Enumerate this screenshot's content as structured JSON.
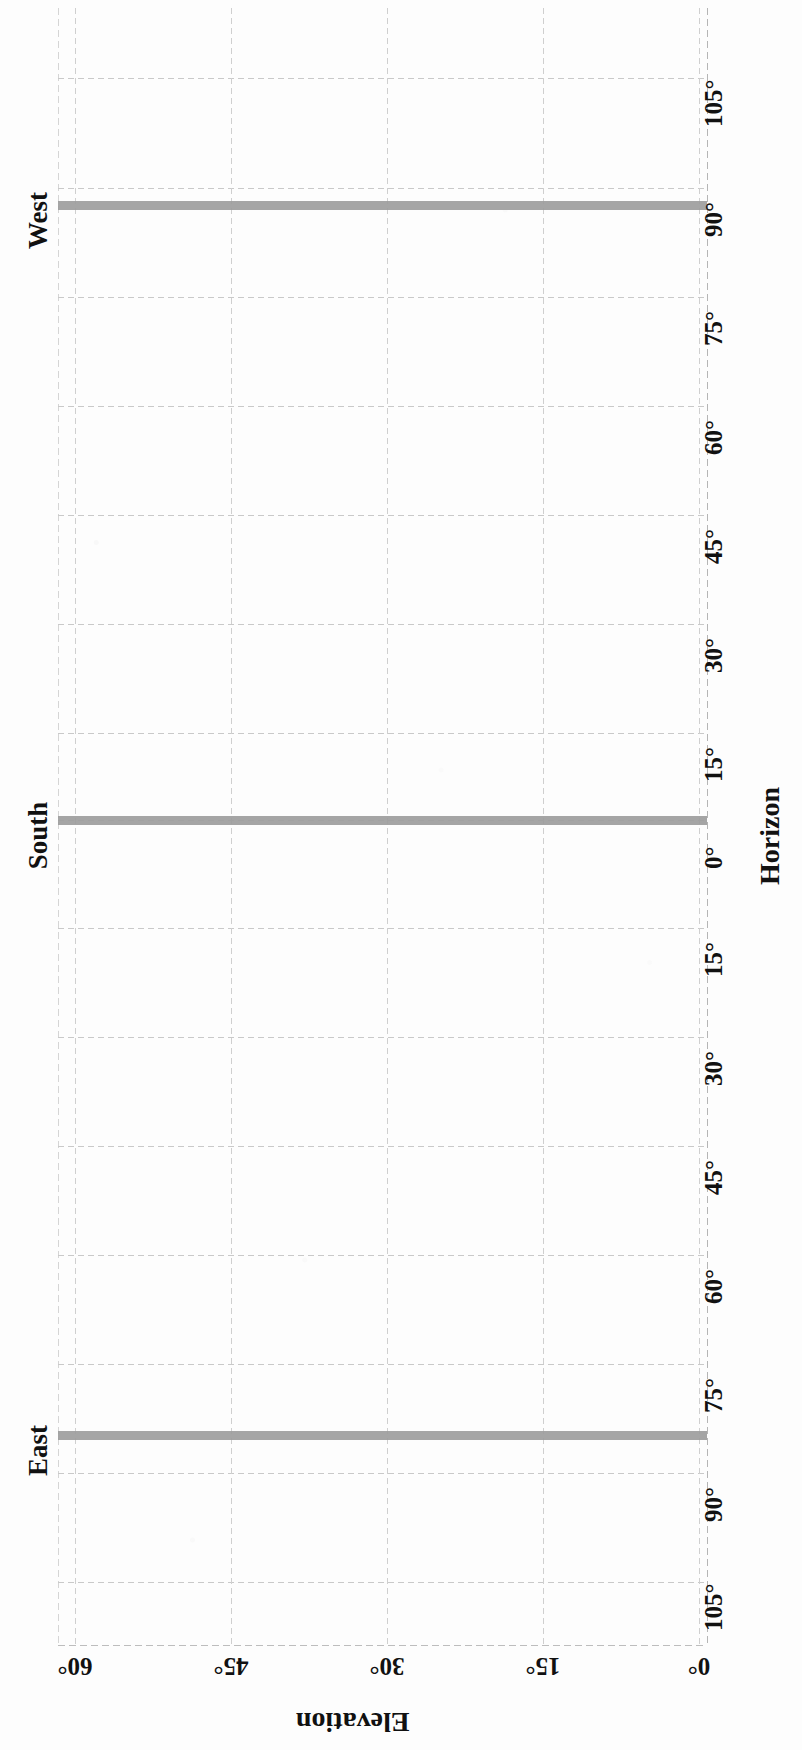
{
  "chart_data": {
    "type": "line",
    "title": "",
    "subtitle": "",
    "orientation": "page rotated 90 degrees clockwise",
    "xlabel": "Elevation",
    "ylabel": "Horizon",
    "x_axis": {
      "name": "Elevation",
      "tick_labels": [
        "60°",
        "45°",
        "30°",
        "15°",
        "0°"
      ],
      "tick_values": [
        60,
        45,
        30,
        15,
        0
      ],
      "range": [
        60,
        0
      ],
      "grid": true
    },
    "y_axis": {
      "name": "Horizon",
      "tick_labels": [
        "105°",
        "90°",
        "75°",
        "60°",
        "45°",
        "30°",
        "15°",
        "0°",
        "15°",
        "30°",
        "45°",
        "60°",
        "75°",
        "90°",
        "105°"
      ],
      "tick_values": [
        105,
        90,
        75,
        60,
        45,
        30,
        15,
        0,
        -15,
        -30,
        -45,
        -60,
        -75,
        -90,
        -105
      ],
      "range": [
        105,
        -105
      ],
      "grid": true
    },
    "direction_markers": [
      {
        "label": "West",
        "azimuth": 90
      },
      {
        "label": "South",
        "azimuth": 0
      },
      {
        "label": "East",
        "azimuth": -90
      }
    ],
    "series": [
      {
        "name": "West horizon trace",
        "azimuth": 90,
        "elevation_start": 60,
        "elevation_end": 0,
        "value": 0
      },
      {
        "name": "South horizon trace",
        "azimuth": 0,
        "elevation_start": 60,
        "elevation_end": 0,
        "value": 0
      },
      {
        "name": "East horizon trace",
        "azimuth": -90,
        "elevation_start": 60,
        "elevation_end": 0,
        "value": 0
      }
    ],
    "legend": {
      "visible": false,
      "position": "none"
    },
    "series_color": "#9d9d9d",
    "gridline_color": "#cfcfcf",
    "text_color": "#111111",
    "background": "#ffffff"
  },
  "axis": {
    "azimuth_ticks": [
      {
        "label": "105°",
        "top": 78
      },
      {
        "label": "90°",
        "top": 188
      },
      {
        "label": "75°",
        "top": 297
      },
      {
        "label": "60°",
        "top": 406
      },
      {
        "label": "45°",
        "top": 515
      },
      {
        "label": "30°",
        "top": 624
      },
      {
        "label": "15°",
        "top": 733
      },
      {
        "label": "0°",
        "top": 820
      },
      {
        "label": "15°",
        "top": 928
      },
      {
        "label": "30°",
        "top": 1037
      },
      {
        "label": "45°",
        "top": 1146
      },
      {
        "label": "60°",
        "top": 1255
      },
      {
        "label": "75°",
        "top": 1364
      },
      {
        "label": "90°",
        "top": 1473
      },
      {
        "label": "105°",
        "top": 1582
      }
    ],
    "elevation_ticks": [
      {
        "label": "60°",
        "left": 75
      },
      {
        "label": "45°",
        "left": 231
      },
      {
        "label": "30°",
        "left": 387
      },
      {
        "label": "15°",
        "left": 543
      },
      {
        "label": "0°",
        "left": 699
      }
    ]
  },
  "directions": [
    {
      "label": "West",
      "top": 205,
      "left": 38
    },
    {
      "label": "South",
      "top": 820,
      "left": 38
    },
    {
      "label": "East",
      "top": 1435,
      "left": 38
    }
  ],
  "bars": [
    {
      "name": "west-bar",
      "top": 201,
      "left": 0,
      "width": 649
    },
    {
      "name": "south-bar",
      "top": 816,
      "left": 0,
      "width": 649
    },
    {
      "name": "east-bar",
      "top": 1431,
      "left": 0,
      "width": 649
    }
  ],
  "titles": {
    "horizon": "Horizon",
    "elevation": "Elevation"
  }
}
